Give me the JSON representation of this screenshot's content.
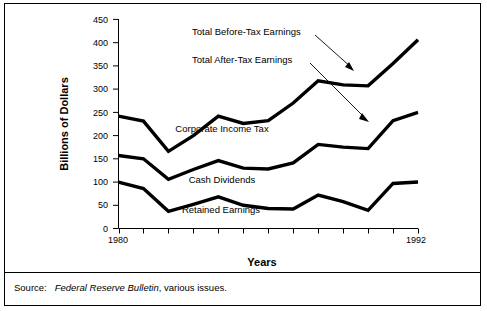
{
  "figure": {
    "source": {
      "label": "Source:",
      "italic_title": "Federal Reserve Bulletin",
      "rest": ", various issues."
    }
  },
  "chart_data": {
    "type": "line",
    "title": "",
    "xlabel": "Years",
    "ylabel": "Billions of Dollars",
    "x": [
      1980,
      1981,
      1982,
      1983,
      1984,
      1985,
      1986,
      1987,
      1988,
      1989,
      1990,
      1991,
      1992
    ],
    "xtick_labels": [
      "1980",
      "1992"
    ],
    "xtick_positions": [
      1980,
      1992
    ],
    "xlim": [
      1980,
      1992
    ],
    "ylim": [
      0,
      450
    ],
    "ytick_labels": [
      "0",
      "50",
      "100",
      "150",
      "200",
      "250",
      "300",
      "350",
      "400",
      "450"
    ],
    "ytick_values": [
      0,
      50,
      100,
      150,
      200,
      250,
      300,
      350,
      400,
      450
    ],
    "grid": false,
    "legend": "inline-annotations",
    "series": [
      {
        "name": "Total Before-Tax Earnings",
        "values": [
          242,
          231,
          166,
          200,
          242,
          226,
          232,
          270,
          318,
          309,
          307,
          355,
          406
        ]
      },
      {
        "name": "Total After-Tax Earnings",
        "values": [
          157,
          150,
          106,
          127,
          146,
          130,
          128,
          141,
          181,
          175,
          172,
          232,
          250
        ]
      },
      {
        "name": "Retained Earnings",
        "values": [
          100,
          86,
          37,
          52,
          68,
          50,
          43,
          42,
          72,
          58,
          39,
          97,
          100
        ]
      }
    ],
    "series_labels": [
      {
        "text": "Corporate Income Tax"
      },
      {
        "text": "Cash Dividends"
      },
      {
        "text": "Retained Earnings"
      }
    ],
    "annotations": [
      {
        "text": "Total Before-Tax Earnings"
      },
      {
        "text": "Total After-Tax Earnings"
      }
    ]
  }
}
